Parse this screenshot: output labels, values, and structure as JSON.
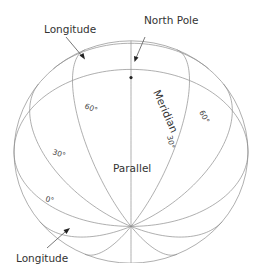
{
  "diagram": {
    "labels": {
      "north_pole": "North Pole",
      "longitude_top": "Longitude",
      "longitude_bottom": "Longitude",
      "meridian": "Meridian",
      "parallel": "Parallel"
    },
    "degree_labels": {
      "lat_60_left": "60°",
      "lat_60_right": "60°",
      "lat_30_left": "30°",
      "lat_30_meridian": "30°",
      "lat_0_left": "0°"
    },
    "graticule": {
      "parallels_deg": [
        0,
        30,
        60,
        80
      ],
      "meridian_step_deg": 30
    },
    "colors": {
      "line": "#8c8c8c",
      "text": "#333333",
      "background": "#ffffff"
    }
  }
}
